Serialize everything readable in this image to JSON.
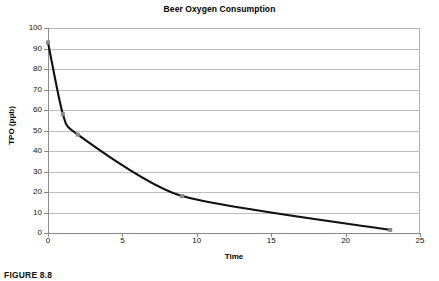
{
  "figure": {
    "caption": "FIGURE 8.8"
  },
  "chart_data": {
    "type": "line",
    "title": "Beer Oxygen Consumption",
    "xlabel": "Time",
    "ylabel": "TPO (ppb)",
    "xlim": [
      0,
      25
    ],
    "ylim": [
      0,
      100
    ],
    "xticks": [
      0,
      5,
      10,
      15,
      20,
      25
    ],
    "yticks": [
      0,
      10,
      20,
      30,
      40,
      50,
      60,
      70,
      80,
      90,
      100
    ],
    "grid": "horizontal",
    "legend": "none",
    "line_color": "#111111",
    "marker_color": "#8c8c8c",
    "gridline_color": "#bdbdbd",
    "series": [
      {
        "name": "TPO",
        "x": [
          0,
          1,
          2,
          9,
          23
        ],
        "values": [
          93,
          58,
          48,
          18,
          1.5
        ]
      }
    ]
  }
}
